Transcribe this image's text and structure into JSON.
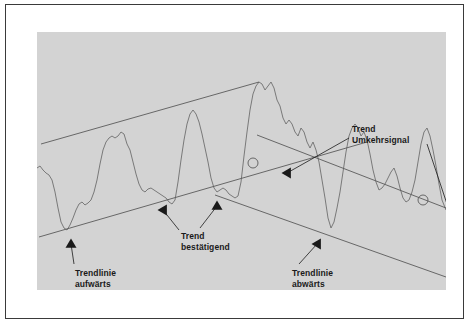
{
  "figure": {
    "background_color": "#d3d3d3",
    "frame_color": "#3a3a3a",
    "curve_color": "#6e6e6e",
    "line_color": "#5a5a5a",
    "text_color": "#1a1a1a"
  },
  "labels": {
    "trendlinie_aufwaerts": "Trendlinie\naufwärts",
    "trend_bestaetigend": "Trend\nbestätigend",
    "trendlinie_abwaerts": "Trendlinie\nabwärts",
    "trend_umkehrsignal": "Trend\nUmkehrsignal"
  },
  "chart_data": {
    "type": "line",
    "xlabel": "",
    "ylabel": "",
    "grid": false,
    "legend": null,
    "xlim": [
      0,
      409
    ],
    "ylim": [
      0,
      258
    ],
    "annotations": [
      {
        "name": "trendlinie-aufwaerts",
        "text": "Trendlinie\naufwärts",
        "arrow_from": [
          37,
          232
        ],
        "arrow_to": [
          34,
          212
        ],
        "marker": "triangle-up"
      },
      {
        "name": "trend-bestaetigend",
        "text": "Trend\nbestätigend",
        "arrow_from": [
          142,
          198
        ],
        "arrow_to": [
          126,
          178
        ],
        "marker": "triangle-left"
      },
      {
        "name": "trend-bestaetigend-second-arrow",
        "text": "",
        "arrow_from": [
          163,
          196
        ],
        "arrow_to": [
          180,
          174
        ],
        "marker": "triangle-up"
      },
      {
        "name": "trendlinie-abwaerts",
        "text": "Trendlinie\nabwärts",
        "arrow_from": [
          262,
          232
        ],
        "arrow_to": [
          280,
          212
        ],
        "marker": "triangle-left"
      },
      {
        "name": "trend-umkehrsignal-left",
        "text": "Trend\nUmkehrsignal",
        "arrow_from": [
          312,
          106
        ],
        "arrow_to": [
          250,
          141
        ],
        "marker": "triangle-left"
      },
      {
        "name": "trend-umkehrsignal-right",
        "text": "",
        "arrow_from": [
          390,
          112
        ],
        "arrow_to": [
          413,
          181
        ],
        "marker": "triangle-right"
      }
    ],
    "trendlines": [
      {
        "name": "uptrend-upper-channel",
        "direction": "up",
        "points": [
          [
            4,
            112
          ],
          [
            222,
            50
          ]
        ]
      },
      {
        "name": "uptrend-lower-channel",
        "direction": "up",
        "points": [
          [
            2,
            205
          ],
          [
            330,
            110
          ]
        ]
      },
      {
        "name": "downtrend-upper-channel",
        "direction": "down",
        "points": [
          [
            220,
            103
          ],
          [
            409,
            176
          ]
        ]
      },
      {
        "name": "downtrend-lower-channel",
        "direction": "down",
        "points": [
          [
            178,
            163
          ],
          [
            409,
            245
          ]
        ]
      }
    ],
    "reversal_markers": [
      {
        "name": "reversal-point-1",
        "position": [
          216,
          131
        ],
        "radius": 5
      },
      {
        "name": "reversal-point-2",
        "position": [
          386,
          168
        ],
        "radius": 5
      }
    ],
    "series": [
      {
        "name": "price",
        "x": [
          0,
          3,
          6,
          9,
          12,
          15,
          18,
          21,
          24,
          27,
          30,
          33,
          36,
          39,
          42,
          45,
          48,
          51,
          54,
          57,
          60,
          63,
          66,
          69,
          72,
          75,
          78,
          81,
          84,
          87,
          90,
          93,
          96,
          99,
          102,
          105,
          108,
          111,
          114,
          117,
          120,
          123,
          126,
          129,
          132,
          135,
          138,
          141,
          144,
          147,
          150,
          153,
          156,
          159,
          162,
          165,
          168,
          171,
          174,
          177,
          180,
          183,
          186,
          189,
          192,
          195,
          198,
          201,
          204,
          207,
          210,
          213,
          216,
          219,
          222,
          225,
          228,
          231,
          234,
          237,
          240,
          243,
          246,
          249,
          252,
          255,
          258,
          261,
          264,
          267,
          270,
          273,
          276,
          279,
          282,
          285,
          288,
          291,
          294,
          297,
          300,
          303,
          306,
          309,
          312,
          315,
          318,
          321,
          324,
          327,
          330,
          333,
          336,
          339,
          342,
          345,
          348,
          351,
          354,
          357,
          360,
          363,
          366,
          369,
          372,
          375,
          378,
          381,
          384,
          387,
          390,
          393,
          396,
          399,
          402,
          405,
          409
        ],
        "y": [
          136,
          134,
          138,
          141,
          143,
          148,
          160,
          176,
          190,
          196,
          198,
          193,
          186,
          178,
          172,
          170,
          173,
          171,
          168,
          160,
          148,
          132,
          118,
          110,
          106,
          104,
          106,
          104,
          100,
          102,
          112,
          118,
          130,
          142,
          152,
          158,
          160,
          157,
          156,
          158,
          160,
          162,
          164,
          166,
          170,
          172,
          168,
          150,
          128,
          108,
          92,
          82,
          78,
          82,
          90,
          102,
          116,
          130,
          146,
          156,
          160,
          158,
          156,
          158,
          162,
          164,
          166,
          164,
          150,
          124,
          100,
          78,
          62,
          54,
          50,
          52,
          58,
          54,
          50,
          56,
          68,
          74,
          86,
          92,
          88,
          92,
          100,
          104,
          96,
          100,
          110,
          116,
          110,
          118,
          130,
          148,
          166,
          186,
          196,
          190,
          176,
          160,
          140,
          120,
          104,
          96,
          92,
          96,
          104,
          100,
          108,
          122,
          138,
          150,
          158,
          156,
          152,
          146,
          140,
          136,
          144,
          156,
          166,
          170,
          168,
          160,
          148,
          130,
          112,
          100,
          96,
          104,
          118,
          134,
          152,
          168,
          178
        ]
      }
    ]
  }
}
